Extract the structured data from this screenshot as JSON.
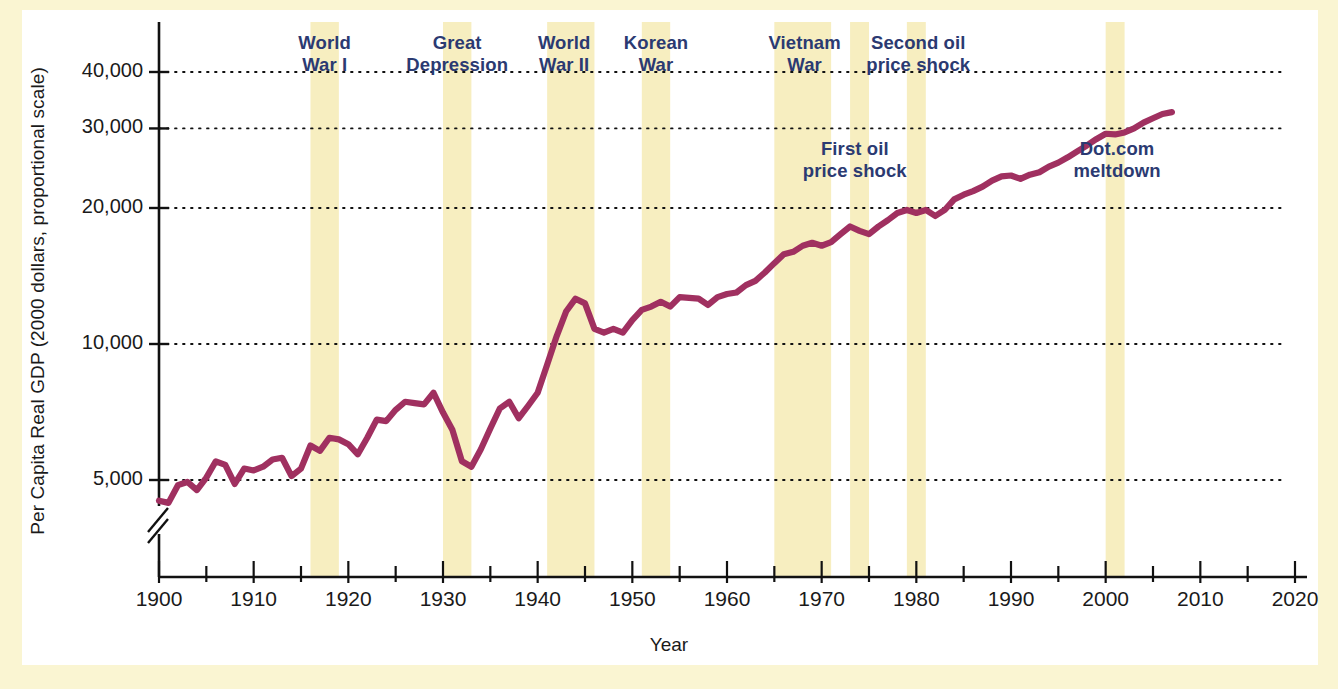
{
  "figure": {
    "background_color": "#faf5d2",
    "plot_background": "#ffffff",
    "line_color": "#a03060",
    "band_color": "#f7eec0",
    "annotation_color": "#2b3a72",
    "axis_color": "#1a1a1a"
  },
  "chart_data": {
    "type": "line",
    "title": "",
    "xlabel": "Year",
    "ylabel": "Per Capita Real GDP (2000 dollars, proportional scale)",
    "yscale": "log",
    "ylim": [
      4200,
      47000
    ],
    "xlim": [
      1900,
      2020
    ],
    "grid": true,
    "grid_style": "dotted horizontal",
    "legend": "none",
    "ytick_labels": [
      "5,000",
      "10,000",
      "20,000",
      "30,000",
      "40,000"
    ],
    "ytick_values": [
      5000,
      10000,
      20000,
      30000,
      40000
    ],
    "xtick_labels": [
      "1900",
      "1910",
      "1920",
      "1930",
      "1940",
      "1950",
      "1960",
      "1970",
      "1980",
      "1990",
      "2000",
      "2010",
      "2020"
    ],
    "xtick_values": [
      1900,
      1910,
      1920,
      1930,
      1940,
      1950,
      1960,
      1970,
      1980,
      1990,
      2000,
      2010,
      2020
    ],
    "minor_tick_interval": 5,
    "axis_break": "y-axis break below 5,000",
    "series": [
      {
        "name": "Per Capita Real GDP",
        "x": [
          1900,
          1901,
          1902,
          1903,
          1904,
          1905,
          1906,
          1907,
          1908,
          1909,
          1910,
          1911,
          1912,
          1913,
          1914,
          1915,
          1916,
          1917,
          1918,
          1919,
          1920,
          1921,
          1922,
          1923,
          1924,
          1925,
          1926,
          1927,
          1928,
          1929,
          1930,
          1931,
          1932,
          1933,
          1934,
          1935,
          1936,
          1937,
          1938,
          1939,
          1940,
          1941,
          1942,
          1943,
          1944,
          1945,
          1946,
          1947,
          1948,
          1949,
          1950,
          1951,
          1952,
          1953,
          1954,
          1955,
          1956,
          1957,
          1958,
          1959,
          1960,
          1961,
          1962,
          1963,
          1964,
          1965,
          1966,
          1967,
          1968,
          1969,
          1970,
          1971,
          1972,
          1973,
          1974,
          1975,
          1976,
          1977,
          1978,
          1979,
          1980,
          1981,
          1982,
          1983,
          1984,
          1985,
          1986,
          1987,
          1988,
          1989,
          1990,
          1991,
          1992,
          1993,
          1994,
          1995,
          1996,
          1997,
          1998,
          1999,
          2000,
          2001,
          2002,
          2003,
          2004,
          2005,
          2006,
          2007
        ],
        "values": [
          4500,
          4450,
          4870,
          4950,
          4750,
          5060,
          5500,
          5400,
          4900,
          5300,
          5250,
          5350,
          5550,
          5600,
          5100,
          5300,
          5960,
          5800,
          6200,
          6150,
          6000,
          5700,
          6200,
          6800,
          6750,
          7150,
          7450,
          7400,
          7350,
          7800,
          7050,
          6450,
          5500,
          5350,
          5850,
          6500,
          7200,
          7450,
          6850,
          7300,
          7800,
          9000,
          10400,
          11800,
          12600,
          12300,
          10800,
          10600,
          10800,
          10600,
          11300,
          11900,
          12100,
          12400,
          12100,
          12700,
          12650,
          12600,
          12200,
          12700,
          12900,
          13000,
          13500,
          13800,
          14400,
          15100,
          15800,
          16000,
          16500,
          16750,
          16500,
          16800,
          17500,
          18200,
          17800,
          17500,
          18200,
          18800,
          19500,
          19800,
          19500,
          19800,
          19200,
          19800,
          20900,
          21400,
          21800,
          22300,
          23000,
          23500,
          23600,
          23200,
          23700,
          24000,
          24700,
          25200,
          25900,
          26700,
          27500,
          28400,
          29200,
          29100,
          29400,
          30000,
          30900,
          31600,
          32300,
          32600
        ]
      }
    ],
    "shaded_event_bands": [
      {
        "label": "World\nWar I",
        "start": 1916,
        "end": 1919,
        "label_x": 1917.5,
        "label_row": "top"
      },
      {
        "label": "Great\nDepression",
        "start": 1930,
        "end": 1933,
        "label_x": 1931.5,
        "label_row": "top"
      },
      {
        "label": "World\nWar II",
        "start": 1941,
        "end": 1946,
        "label_x": 1942.8,
        "label_row": "top"
      },
      {
        "label": "Korean\nWar",
        "start": 1951,
        "end": 1954,
        "label_x": 1952.5,
        "label_row": "top"
      },
      {
        "label": "Vietnam\nWar",
        "start": 1965,
        "end": 1971,
        "label_x": 1968.2,
        "label_row": "top"
      },
      {
        "label": "First oil\nprice shock",
        "start": 1973,
        "end": 1975,
        "label_x": 1973.5,
        "label_row": "middle"
      },
      {
        "label": "Second oil\nprice shock",
        "start": 1979,
        "end": 1981,
        "label_x": 1980.2,
        "label_row": "top"
      },
      {
        "label": "Dot.com\nmeltdown",
        "start": 2000,
        "end": 2002,
        "label_x": 2001.2,
        "label_row": "middle"
      }
    ]
  },
  "annotations": [
    {
      "id": "world-war-i",
      "line1": "World",
      "line2": "War I"
    },
    {
      "id": "great-depression",
      "line1": "Great",
      "line2": "Depression"
    },
    {
      "id": "world-war-ii",
      "line1": "World",
      "line2": "War II"
    },
    {
      "id": "korean-war",
      "line1": "Korean",
      "line2": "War"
    },
    {
      "id": "vietnam-war",
      "line1": "Vietnam",
      "line2": "War"
    },
    {
      "id": "second-oil-price-shock",
      "line1": "Second oil",
      "line2": "price shock"
    },
    {
      "id": "first-oil-price-shock",
      "line1": "First oil",
      "line2": "price shock"
    },
    {
      "id": "dotcom-meltdown",
      "line1": "Dot.com",
      "line2": "meltdown"
    }
  ],
  "axis": {
    "y_title": "Per Capita Real GDP (2000 dollars, proportional scale)",
    "x_title": "Year"
  }
}
